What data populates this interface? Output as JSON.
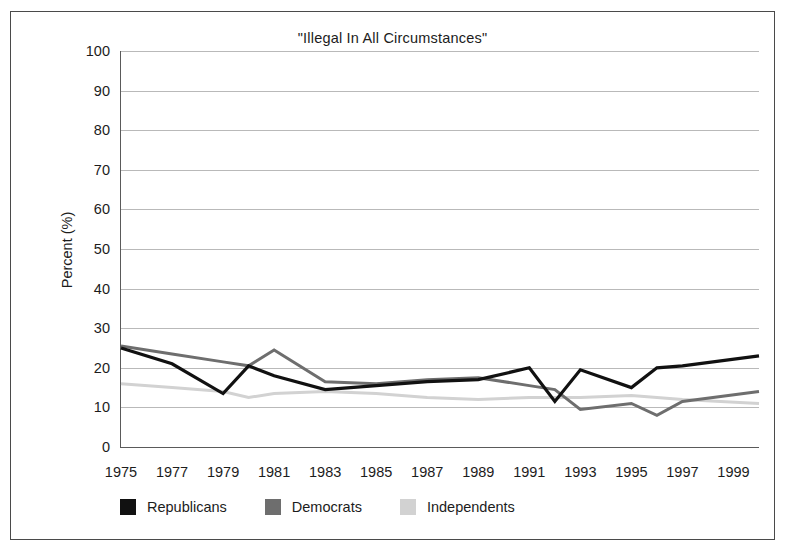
{
  "chart_data": {
    "type": "line",
    "title": "\"Illegal In All Circumstances\"",
    "xlabel": "",
    "ylabel": "Percent (%)",
    "ylim": [
      0,
      100
    ],
    "xlim": [
      1975,
      2000
    ],
    "ytick_values": [
      0,
      10,
      20,
      30,
      40,
      50,
      60,
      70,
      80,
      90,
      100
    ],
    "ytick_labels": [
      "0",
      "10",
      "20",
      "30",
      "40",
      "50",
      "60",
      "70",
      "80",
      "90",
      "100"
    ],
    "xtick_values": [
      1975,
      1977,
      1979,
      1981,
      1983,
      1985,
      1987,
      1989,
      1991,
      1993,
      1995,
      1997,
      1999
    ],
    "xtick_labels": [
      "1975",
      "1977",
      "1979",
      "1981",
      "1983",
      "1985",
      "1987",
      "1989",
      "1991",
      "1993",
      "1995",
      "1997",
      "1999"
    ],
    "grid": true,
    "legend_position": "below-left",
    "x": [
      1975,
      1977,
      1979,
      1980,
      1981,
      1983,
      1985,
      1987,
      1989,
      1991,
      1992,
      1993,
      1995,
      1996,
      1997,
      2000
    ],
    "series": [
      {
        "name": "Republicans",
        "color": "#111111",
        "values": [
          25.0,
          21.0,
          13.5,
          20.5,
          18.0,
          14.5,
          15.5,
          16.5,
          17.0,
          20.0,
          11.5,
          19.5,
          15.0,
          20.0,
          20.5,
          23.0
        ]
      },
      {
        "name": "Democrats",
        "color": "#6e6e6e",
        "values": [
          25.5,
          23.5,
          21.5,
          20.5,
          24.5,
          16.5,
          16.0,
          17.0,
          17.5,
          15.5,
          14.5,
          9.5,
          11.0,
          8.0,
          11.5,
          14.0
        ]
      },
      {
        "name": "Independents",
        "color": "#d2d2d2",
        "values": [
          16.0,
          15.0,
          14.0,
          12.5,
          13.5,
          14.0,
          13.5,
          12.5,
          12.0,
          12.5,
          12.5,
          12.5,
          13.0,
          12.5,
          12.0,
          11.0
        ]
      }
    ]
  },
  "legend": {
    "items": [
      {
        "label": "Republicans",
        "color": "#111111"
      },
      {
        "label": "Democrats",
        "color": "#6e6e6e"
      },
      {
        "label": "Independents",
        "color": "#d2d2d2"
      }
    ]
  }
}
